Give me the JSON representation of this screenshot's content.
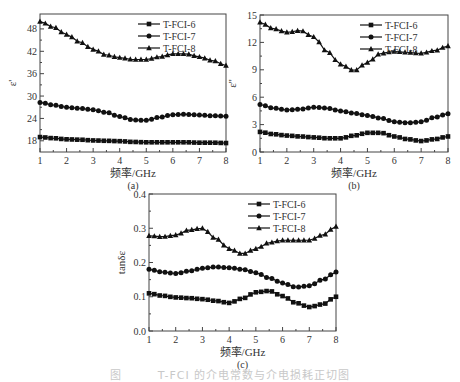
{
  "figure": {
    "caption": "图　　　T-FCI 的介电常数与介电损耗正切图"
  },
  "chart_data": [
    {
      "id": "a",
      "type": "line",
      "panel_label": "(a)",
      "title": "",
      "xlabel": "频率/GHz",
      "ylabel": "ε'",
      "xlim": [
        1,
        8
      ],
      "ylim": [
        15,
        52
      ],
      "xticks": [
        1,
        2,
        3,
        4,
        5,
        6,
        7,
        8
      ],
      "yticks": [
        18,
        24,
        30,
        36,
        42,
        48
      ],
      "ytick_labels": [
        "18",
        "24",
        "30",
        "36",
        "42",
        "48"
      ],
      "grid": false,
      "legend_position": "upper right",
      "x": [
        1,
        1.5,
        2,
        2.5,
        3,
        3.5,
        4,
        4.5,
        5,
        5.5,
        6,
        6.5,
        7,
        7.5,
        8
      ],
      "series": [
        {
          "name": "T-FCI-6",
          "marker": "square",
          "values": [
            19.0,
            18.7,
            18.4,
            18.3,
            18.1,
            18.0,
            17.9,
            17.7,
            17.6,
            17.6,
            17.6,
            17.6,
            17.5,
            17.5,
            17.4
          ]
        },
        {
          "name": "T-FCI-7",
          "marker": "circle",
          "values": [
            28.3,
            27.6,
            27.0,
            26.7,
            26.3,
            25.6,
            24.5,
            23.6,
            23.5,
            24.3,
            25.0,
            25.1,
            24.9,
            24.7,
            24.6
          ]
        },
        {
          "name": "T-FCI-8",
          "marker": "triangle",
          "values": [
            50.0,
            48.5,
            46.5,
            44.5,
            42.5,
            41.0,
            40.3,
            39.8,
            39.8,
            40.5,
            41.3,
            41.3,
            40.5,
            39.5,
            38.2
          ]
        }
      ]
    },
    {
      "id": "b",
      "type": "line",
      "panel_label": "(b)",
      "title": "",
      "xlabel": "频率/GHz",
      "ylabel": "ε''",
      "xlim": [
        1,
        8
      ],
      "ylim": [
        0,
        15
      ],
      "xticks": [
        1,
        2,
        3,
        4,
        5,
        6,
        7,
        8
      ],
      "yticks": [
        0,
        3,
        6,
        9,
        12,
        15
      ],
      "ytick_labels": [
        "0",
        "3",
        "6",
        "9",
        "12",
        "15"
      ],
      "grid": false,
      "legend_position": "upper right",
      "x": [
        1,
        1.5,
        2,
        2.5,
        3,
        3.5,
        4,
        4.5,
        5,
        5.5,
        6,
        6.5,
        7,
        7.5,
        8
      ],
      "series": [
        {
          "name": "T-FCI-6",
          "marker": "square",
          "values": [
            2.2,
            1.95,
            1.8,
            1.7,
            1.6,
            1.5,
            1.5,
            1.8,
            2.1,
            2.1,
            1.7,
            1.4,
            1.2,
            1.4,
            1.7
          ]
        },
        {
          "name": "T-FCI-7",
          "marker": "circle",
          "values": [
            5.2,
            4.8,
            4.6,
            4.7,
            4.9,
            4.8,
            4.5,
            4.25,
            4.0,
            3.7,
            3.3,
            3.2,
            3.3,
            3.8,
            4.2
          ]
        },
        {
          "name": "T-FCI-8",
          "marker": "triangle",
          "values": [
            14.2,
            13.5,
            13.1,
            13.3,
            12.6,
            11.0,
            9.6,
            8.9,
            9.8,
            10.8,
            11.0,
            10.9,
            10.8,
            11.1,
            11.6
          ]
        }
      ]
    },
    {
      "id": "c",
      "type": "line",
      "panel_label": "(c)",
      "title": "",
      "xlabel": "频率/GHz",
      "ylabel": "tanδε",
      "xlim": [
        1,
        8
      ],
      "ylim": [
        0.0,
        0.4
      ],
      "xticks": [
        1,
        2,
        3,
        4,
        5,
        6,
        7,
        8
      ],
      "yticks": [
        0.0,
        0.1,
        0.2,
        0.3,
        0.4
      ],
      "ytick_labels": [
        "0.0",
        "0.1",
        "0.2",
        "0.3",
        "0.4"
      ],
      "grid": false,
      "legend_position": "upper right",
      "x": [
        1,
        1.5,
        2,
        2.5,
        3,
        3.5,
        4,
        4.5,
        5,
        5.5,
        6,
        6.5,
        7,
        7.5,
        8
      ],
      "series": [
        {
          "name": "T-FCI-6",
          "marker": "square",
          "values": [
            0.11,
            0.103,
            0.098,
            0.096,
            0.093,
            0.088,
            0.082,
            0.095,
            0.113,
            0.117,
            0.102,
            0.082,
            0.07,
            0.078,
            0.1
          ]
        },
        {
          "name": "T-FCI-7",
          "marker": "circle",
          "values": [
            0.18,
            0.172,
            0.168,
            0.175,
            0.183,
            0.187,
            0.185,
            0.18,
            0.17,
            0.155,
            0.14,
            0.128,
            0.132,
            0.15,
            0.172
          ]
        },
        {
          "name": "T-FCI-8",
          "marker": "triangle",
          "values": [
            0.278,
            0.275,
            0.28,
            0.295,
            0.3,
            0.27,
            0.24,
            0.225,
            0.24,
            0.258,
            0.265,
            0.265,
            0.265,
            0.28,
            0.305
          ]
        }
      ]
    }
  ]
}
